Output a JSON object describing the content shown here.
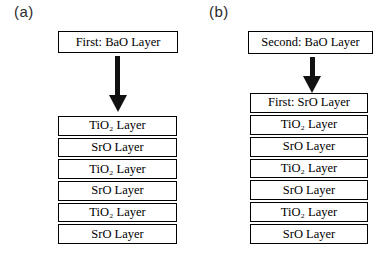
{
  "figure": {
    "type": "layer-deposition-diagram",
    "colors": {
      "background": "#ffffff",
      "border": "#000000",
      "arrow": "#111111",
      "text": "#000000"
    },
    "panels": [
      {
        "label": "(a)",
        "source_box": "First: BaO Layer",
        "arrow": "down-arrow",
        "stack": [
          "TiO₂ Layer",
          "SrO Layer",
          "TiO₂ Layer",
          "SrO Layer",
          "TiO₂ Layer",
          "SrO Layer"
        ]
      },
      {
        "label": "(b)",
        "source_box": "Second: BaO Layer",
        "arrow": "down-arrow",
        "stack": [
          "First: SrO Layer",
          "TiO₂ Layer",
          "SrO Layer",
          "TiO₂ Layer",
          "SrO Layer",
          "TiO₂ Layer",
          "SrO Layer"
        ]
      }
    ]
  }
}
